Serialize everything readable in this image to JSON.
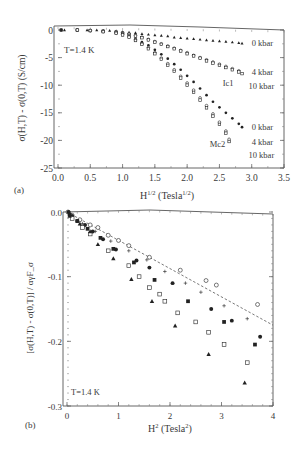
{
  "chart_data": [
    {
      "panel_label": "(a)",
      "type": "scatter",
      "title": "",
      "xlabel": "H^{1/2} (Tesla^{1/2})",
      "xlabel_main": "H",
      "xlabel_sup": "1/2",
      "xlabel_unit_pre": " (Tesla",
      "xlabel_unit_sup": "1/2",
      "xlabel_unit_post": ")",
      "ylabel": "σ(H,T) - σ(0,T) (S/cm)",
      "xlim": [
        0.0,
        3.5
      ],
      "ylim": [
        -25,
        0
      ],
      "xticks": [
        "0.0",
        "0.5",
        "1.0",
        "1.5",
        "2.0",
        "2.5",
        "3.0",
        "3.5"
      ],
      "yticks": [
        "0",
        "-5",
        "-10",
        "-15",
        "-20",
        "-25"
      ],
      "grid": false,
      "annotation": "T=1.4 K",
      "group_labels": [
        {
          "text": "Ic1",
          "x": 2.55,
          "y": -9.6
        },
        {
          "text": "Mc2",
          "x": 2.35,
          "y": -20.6
        }
      ],
      "series_labels": [
        {
          "text": "0 kbar",
          "x": 3.0,
          "y": -2.3
        },
        {
          "text": "4 kbar",
          "x": 3.0,
          "y": -7.6
        },
        {
          "text": "10 kbar",
          "x": 2.95,
          "y": -10.2
        },
        {
          "text": "0 kbar",
          "x": 3.0,
          "y": -17.6
        },
        {
          "text": "4 kbar",
          "x": 3.0,
          "y": -20.2
        },
        {
          "text": "10 kbar",
          "x": 2.95,
          "y": -22.6
        }
      ],
      "series": [
        {
          "name": "Ic1 0 kbar",
          "marker": "filled-triangle",
          "x": [
            0.05,
            0.1,
            0.3,
            0.45,
            0.6,
            0.7,
            0.8,
            0.9,
            1.0,
            1.1,
            1.2,
            1.3,
            1.4,
            1.5,
            1.6,
            1.7,
            1.8,
            1.9,
            2.0,
            2.1,
            2.2,
            2.3,
            2.4,
            2.5,
            2.6,
            2.7,
            2.8,
            2.85
          ],
          "y": [
            0,
            0,
            0,
            0,
            0,
            -0.1,
            -0.1,
            -0.2,
            -0.3,
            -0.4,
            -0.5,
            -0.7,
            -0.8,
            -0.9,
            -1.0,
            -1.1,
            -1.3,
            -1.4,
            -1.5,
            -1.6,
            -1.7,
            -1.8,
            -1.9,
            -2.0,
            -2.1,
            -2.2,
            -2.3,
            -2.4
          ]
        },
        {
          "name": "Ic1 4 kbar",
          "marker": "open-circle",
          "x": [
            0.05,
            0.3,
            0.5,
            0.7,
            0.9,
            1.0,
            1.1,
            1.2,
            1.3,
            1.4,
            1.5,
            1.6,
            1.7,
            1.8,
            1.9,
            2.0,
            2.1,
            2.2,
            2.3,
            2.4,
            2.5,
            2.6,
            2.7,
            2.8
          ],
          "y": [
            0,
            0,
            -0.1,
            -0.2,
            -0.3,
            -0.5,
            -0.7,
            -1.0,
            -1.3,
            -1.7,
            -2.1,
            -2.5,
            -2.9,
            -3.3,
            -3.7,
            -4.1,
            -4.6,
            -5.0,
            -5.4,
            -5.8,
            -6.2,
            -6.6,
            -7.0,
            -7.4
          ]
        },
        {
          "name": "Ic1 10 kbar",
          "marker": "open-square",
          "x": [
            0.05,
            0.3,
            0.5,
            0.7,
            0.9,
            1.0,
            1.1,
            1.2,
            1.3,
            1.4,
            1.5,
            1.6,
            1.7,
            1.8,
            1.9,
            2.0,
            2.1,
            2.2,
            2.3,
            2.4,
            2.5,
            2.6,
            2.7,
            2.8,
            2.85
          ],
          "y": [
            0,
            0,
            -0.1,
            -0.2,
            -0.4,
            -0.6,
            -0.8,
            -1.1,
            -1.4,
            -1.8,
            -2.2,
            -2.6,
            -3.0,
            -3.4,
            -3.8,
            -4.3,
            -4.7,
            -5.1,
            -5.6,
            -6.0,
            -6.4,
            -6.8,
            -7.2,
            -7.6,
            -7.9
          ]
        },
        {
          "name": "Mc2 0 kbar",
          "marker": "filled-circle",
          "x": [
            0.05,
            0.3,
            0.5,
            0.7,
            0.9,
            1.0,
            1.1,
            1.2,
            1.3,
            1.4,
            1.5,
            1.6,
            1.7,
            1.8,
            1.9,
            2.0,
            2.1,
            2.2,
            2.3,
            2.4,
            2.5,
            2.6,
            2.7,
            2.8,
            2.85
          ],
          "y": [
            0,
            0,
            -0.1,
            -0.3,
            -0.5,
            -0.7,
            -1.0,
            -1.6,
            -2.2,
            -2.8,
            -3.6,
            -4.4,
            -5.2,
            -6.2,
            -7.2,
            -8.3,
            -9.4,
            -10.6,
            -11.8,
            -13.0,
            -14.0,
            -15.0,
            -16.0,
            -17.0,
            -17.6
          ]
        },
        {
          "name": "Mc2 4 kbar",
          "marker": "open-circle",
          "x": [
            0.3,
            0.5,
            0.7,
            0.9,
            1.0,
            1.1,
            1.2,
            1.3,
            1.4,
            1.5,
            1.6,
            1.7,
            1.8,
            1.9,
            2.0,
            2.1,
            2.2,
            2.3,
            2.4,
            2.5,
            2.6,
            2.65
          ],
          "y": [
            0,
            -0.1,
            -0.3,
            -0.6,
            -0.8,
            -1.2,
            -1.8,
            -2.5,
            -3.2,
            -4.1,
            -5.1,
            -6.1,
            -7.2,
            -8.4,
            -9.6,
            -10.9,
            -12.3,
            -13.7,
            -15.2,
            -16.7,
            -18.3,
            -19.8
          ]
        },
        {
          "name": "Mc2 10 kbar",
          "marker": "open-square",
          "x": [
            0.3,
            0.5,
            0.7,
            0.9,
            1.0,
            1.1,
            1.2,
            1.3,
            1.4,
            1.5,
            1.6,
            1.7,
            1.8,
            1.9,
            2.0,
            2.1,
            2.2,
            2.3,
            2.4,
            2.5,
            2.6,
            2.65
          ],
          "y": [
            0,
            -0.1,
            -0.3,
            -0.6,
            -0.9,
            -1.3,
            -1.9,
            -2.6,
            -3.4,
            -4.3,
            -5.3,
            -6.4,
            -7.5,
            -8.7,
            -10.0,
            -11.3,
            -12.7,
            -14.1,
            -15.6,
            -17.1,
            -18.7,
            -20.2
          ]
        }
      ]
    },
    {
      "panel_label": "(b)",
      "type": "scatter",
      "title": "",
      "xlabel": "H^2 (Tesla^2)",
      "xlabel_main": "H",
      "xlabel_sup": "2",
      "xlabel_unit_pre": " (Tesla",
      "xlabel_unit_sup": "2",
      "xlabel_unit_post": ")",
      "ylabel": "[σ(H,T) - σ(0,T)] / αγF_σ",
      "xlim": [
        0,
        4
      ],
      "ylim": [
        -0.3,
        0.0
      ],
      "xticks": [
        "0",
        "1",
        "2",
        "3",
        "4"
      ],
      "yticks": [
        "0.0",
        "-0.1",
        "-0.2",
        "-0.3"
      ],
      "grid": false,
      "annotation": "T=1.4 K",
      "reference_line": {
        "style": "dashed",
        "x": [
          0,
          4
        ],
        "y": [
          0.0,
          -0.175
        ]
      },
      "series": [
        {
          "name": "open circles",
          "marker": "open-circle",
          "x": [
            0.02,
            0.1,
            0.25,
            0.45,
            0.6,
            0.8,
            1.0,
            1.2,
            1.6,
            2.2,
            2.7,
            2.9,
            3.7
          ],
          "y": [
            0.0,
            -0.005,
            -0.012,
            -0.02,
            -0.024,
            -0.036,
            -0.044,
            -0.052,
            -0.07,
            -0.09,
            -0.106,
            -0.113,
            -0.143
          ]
        },
        {
          "name": "plus / small",
          "marker": "plus",
          "x": [
            0.3,
            0.55,
            0.85,
            1.2,
            1.55,
            1.9,
            2.3,
            2.6,
            3.05,
            3.5
          ],
          "y": [
            -0.018,
            -0.03,
            -0.045,
            -0.06,
            -0.074,
            -0.092,
            -0.11,
            -0.124,
            -0.145,
            -0.165
          ]
        },
        {
          "name": "filled circles",
          "marker": "filled-circle",
          "x": [
            0.03,
            0.1,
            0.2,
            0.35,
            0.5,
            0.7,
            0.95,
            1.35,
            1.6,
            2.05,
            2.8,
            3.2,
            3.75
          ],
          "y": [
            0.0,
            -0.006,
            -0.014,
            -0.02,
            -0.03,
            -0.042,
            -0.058,
            -0.075,
            -0.086,
            -0.11,
            -0.15,
            -0.168,
            -0.193
          ]
        },
        {
          "name": "filled squares",
          "marker": "filled-square",
          "x": [
            0.05,
            0.2,
            0.4,
            0.65,
            0.9,
            1.3,
            1.7,
            2.35,
            3.05,
            3.65
          ],
          "y": [
            -0.004,
            -0.014,
            -0.026,
            -0.04,
            -0.057,
            -0.078,
            -0.105,
            -0.138,
            -0.17,
            -0.205
          ]
        },
        {
          "name": "open squares",
          "marker": "open-square",
          "x": [
            0.1,
            0.3,
            0.45,
            0.8,
            1.2,
            1.4,
            1.6,
            1.8,
            1.9,
            2.15,
            2.5,
            2.75,
            3.05,
            3.5
          ],
          "y": [
            -0.01,
            -0.024,
            -0.034,
            -0.06,
            -0.083,
            -0.1,
            -0.117,
            -0.127,
            -0.138,
            -0.156,
            -0.17,
            -0.186,
            -0.205,
            -0.233
          ]
        },
        {
          "name": "filled triangles",
          "marker": "filled-triangle",
          "x": [
            0.05,
            0.25,
            0.45,
            0.6,
            0.9,
            1.25,
            1.65,
            2.1,
            2.75,
            3.45
          ],
          "y": [
            -0.006,
            -0.018,
            -0.03,
            -0.05,
            -0.072,
            -0.104,
            -0.138,
            -0.176,
            -0.22,
            -0.264
          ]
        }
      ]
    }
  ]
}
